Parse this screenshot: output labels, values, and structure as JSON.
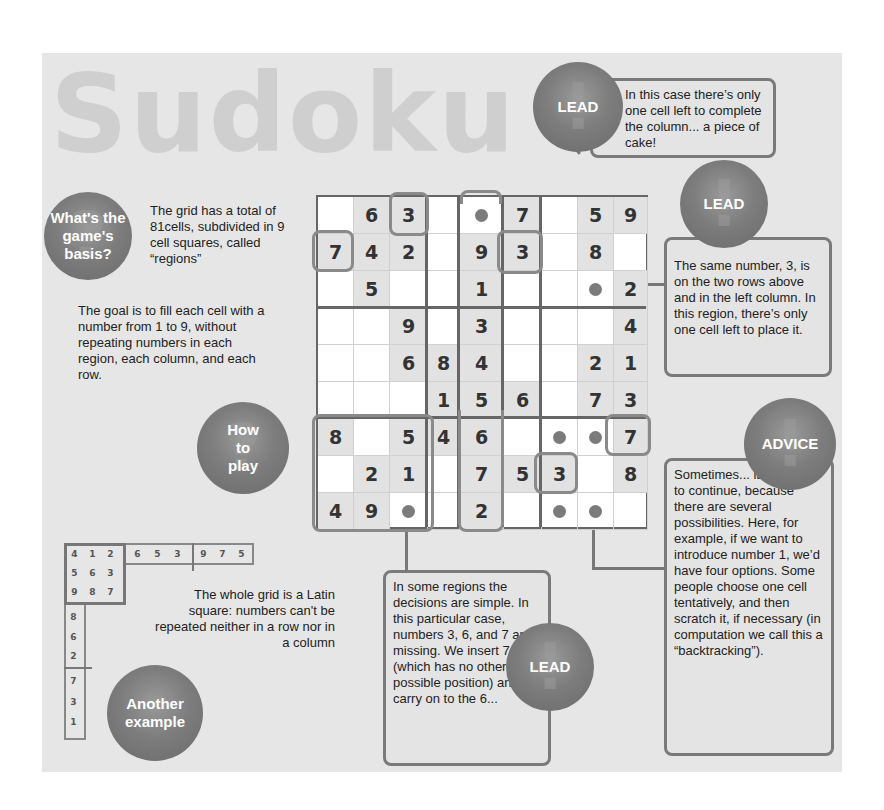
{
  "title": "Sudoku",
  "bubbles": {
    "basis": "What's the game's basis?",
    "how_to_play": "How to play",
    "another_example": "Another example",
    "lead_top": "LEAD",
    "lead_right": "LEAD",
    "lead_bottom": "LEAD",
    "advice": "ADVICE"
  },
  "texts": {
    "basis_text": "The grid has a total of 81cells, subdivided in 9 cell squares, called “regions”",
    "goal_text": "The goal is to fill each cell with a number from 1 to 9, without repeating numbers in each region, each column, and each row.",
    "latin_text": "The whole grid is a Latin square: numbers can't be repeated neither in a row nor in a column"
  },
  "callouts": {
    "lead_top": "In this case there’s only one cell left to complete the column... a piece of cake!",
    "lead_right": "The same number, 3, is on the two rows above and in the left column. In this region, there’s only one cell left to place it.",
    "lead_bottom": "In some regions the decisions are simple. In this particular case, numbers 3, 6, and 7 are missing. We insert 7 (which has no other possible position) and carry on to the 6...",
    "advice": "Sometimes... it’s harder to continue, because there are several possibilities. Here, for example, if we want to introduce number 1, we’d have four options. Some people choose one cell tentatively, and then scratch it, if necessary (in computation we call this a “backtracking”)."
  },
  "grid": [
    [
      "",
      "6",
      "3",
      "",
      "•",
      "7",
      "",
      "5",
      "9"
    ],
    [
      "7",
      "4",
      "2",
      "",
      "9",
      "3",
      "",
      "8",
      ""
    ],
    [
      "",
      "5",
      "",
      "",
      "1",
      "",
      "",
      "•",
      "2"
    ],
    [
      "",
      "",
      "9",
      "",
      "3",
      "",
      "",
      "",
      "4"
    ],
    [
      "",
      "",
      "6",
      "8",
      "4",
      "",
      "",
      "2",
      "1"
    ],
    [
      "",
      "",
      "",
      "1",
      "5",
      "6",
      "",
      "7",
      "3"
    ],
    [
      "8",
      "",
      "5",
      "4",
      "6",
      "",
      "•",
      "•",
      "7"
    ],
    [
      "",
      "2",
      "1",
      "",
      "7",
      "5",
      "3",
      "",
      "8"
    ],
    [
      "4",
      "9",
      "•",
      "",
      "2",
      "",
      "•",
      "•",
      ""
    ]
  ],
  "latin_example": {
    "top_row": [
      "4",
      "1",
      "2",
      "6",
      "5",
      "3",
      "9",
      "7",
      "5"
    ],
    "region": [
      [
        "4",
        "1",
        "2"
      ],
      [
        "5",
        "6",
        "3"
      ],
      [
        "9",
        "8",
        "7"
      ]
    ],
    "left_column": [
      "8",
      "6",
      "2",
      "7",
      "3",
      "1"
    ]
  },
  "colors": {
    "panel": "#e6e6e6",
    "bubble": "#7d7d7d",
    "border": "#7a7a7a",
    "text": "#222222"
  }
}
